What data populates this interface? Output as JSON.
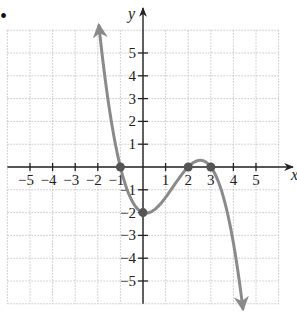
{
  "problem_marker": "•",
  "chart_data": {
    "type": "line",
    "title": "",
    "xlabel": "x",
    "ylabel": "y",
    "xlim": [
      -6,
      6
    ],
    "ylim": [
      -6,
      6
    ],
    "grid": true,
    "x_ticks": [
      -5,
      -4,
      -3,
      -2,
      -1,
      1,
      2,
      3,
      4,
      5
    ],
    "x_tick_labels": [
      "−5",
      "−4",
      "−3",
      "−2",
      "−1",
      "1",
      "2",
      "3",
      "4",
      "5"
    ],
    "y_ticks": [
      5,
      4,
      3,
      2,
      1,
      -1,
      -2,
      -3,
      -4,
      -5
    ],
    "y_tick_labels": [
      "5",
      "4",
      "3",
      "2",
      "1",
      "−1",
      "−2",
      "−3",
      "−4",
      "−5"
    ],
    "series": [
      {
        "name": "f(x)",
        "description": "cubic polynomial with zeros at -1, 2, 3 and y-intercept -2; falls to the right",
        "equation": "f(x) = -(1/3)(x+1)(x-2)(x-3)",
        "x_range": [
          -1.95,
          4.42
        ],
        "arrows": [
          "start",
          "end"
        ],
        "color": "#8a8a8a"
      }
    ],
    "marked_points": [
      {
        "x": -1,
        "y": 0
      },
      {
        "x": 0,
        "y": -2
      },
      {
        "x": 2,
        "y": 0
      },
      {
        "x": 3,
        "y": 0
      }
    ],
    "sample_points": [
      {
        "x": -1.95,
        "y": 6.1
      },
      {
        "x": -1.5,
        "y": 3.85
      },
      {
        "x": -1,
        "y": 0
      },
      {
        "x": -0.5,
        "y": -1.46
      },
      {
        "x": 0,
        "y": -2
      },
      {
        "x": 0.5,
        "y": -1.88
      },
      {
        "x": 1,
        "y": -1.33
      },
      {
        "x": 1.5,
        "y": -0.63
      },
      {
        "x": 2,
        "y": 0
      },
      {
        "x": 2.5,
        "y": 0.29
      },
      {
        "x": 3,
        "y": 0
      },
      {
        "x": 3.5,
        "y": -1.13
      },
      {
        "x": 4,
        "y": -3.33
      },
      {
        "x": 4.42,
        "y": -6.1
      }
    ]
  },
  "colors": {
    "axis": "#222222",
    "grid": "#b8b8b8",
    "curve": "#8a8a8a",
    "point": "#555555"
  }
}
